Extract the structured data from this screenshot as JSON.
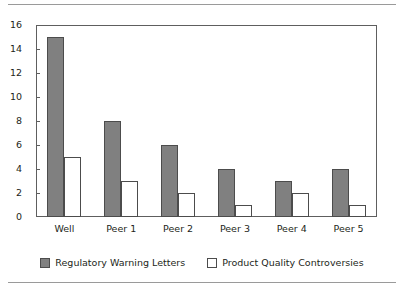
{
  "chart_data": {
    "type": "bar",
    "title": "",
    "subtitle": "",
    "xlabel": "",
    "ylabel": "",
    "categories": [
      "Well",
      "Peer 1",
      "Peer 2",
      "Peer 3",
      "Peer 4",
      "Peer 5"
    ],
    "series": [
      {
        "name": "Regulatory Warning Letters",
        "values": [
          15,
          8,
          6,
          4,
          3,
          4
        ],
        "fill": "#808080",
        "edge": "#4c4c4c",
        "swatch": "filled"
      },
      {
        "name": "Product Quality Controversies",
        "values": [
          5,
          3,
          2,
          1,
          2,
          1
        ],
        "fill": "#ffffff",
        "edge": "#4c4c4c",
        "swatch": "hollow"
      }
    ],
    "ylim": [
      0,
      16
    ],
    "yticks": [
      0,
      2,
      4,
      6,
      8,
      10,
      12,
      14,
      16
    ],
    "ytick_labels": [
      "0",
      "2",
      "4",
      "6",
      "8",
      "10",
      "12",
      "14",
      "16"
    ],
    "grid": false,
    "legend_position": "bottom-center",
    "frame_color": "#5e5e5e",
    "background": "#ffffff"
  },
  "decor": {
    "clipped_caption": "",
    "rule_color": "#9a9a9a"
  }
}
